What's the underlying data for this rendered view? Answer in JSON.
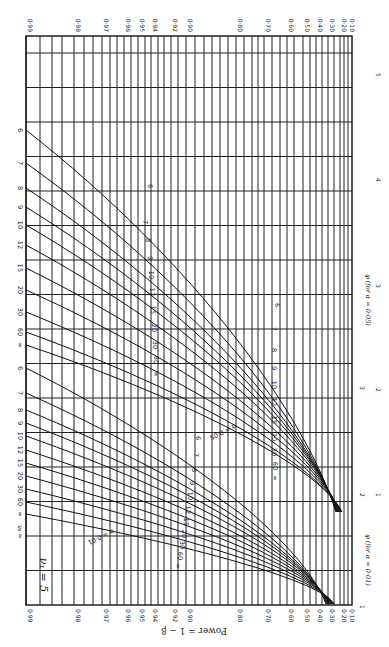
{
  "chart_data": {
    "type": "line",
    "orientation": "rotated 90° counter-clockwise (power axis runs horizontally, φ axis runs vertically)",
    "ylabel": "Power = 1 − β",
    "xlabel_alpha_05": "φ (for α = 0·05)",
    "xlabel_alpha_01": "φ (for α = 0·01)",
    "power_ticks": [
      "0·99",
      "0·98",
      "0·97",
      "0·96",
      "0·95",
      "0·94",
      "0·92",
      "0·90",
      "0·80",
      "0·70",
      "0·60",
      "0·50",
      "0·40",
      "0·30",
      "0·20",
      "0·10"
    ],
    "power_tick_values": [
      0.99,
      0.98,
      0.97,
      0.96,
      0.95,
      0.94,
      0.92,
      0.9,
      0.8,
      0.7,
      0.6,
      0.5,
      0.4,
      0.3,
      0.2,
      0.1
    ],
    "phi_ticks_alpha_05": [
      "1",
      "2",
      "3",
      "4",
      "5"
    ],
    "phi_ticks_alpha_01": [
      "1",
      "2",
      "3"
    ],
    "nu2_values": [
      "6",
      "7",
      "8",
      "9",
      "10",
      "12",
      "15",
      "20",
      "30",
      "60",
      "∞"
    ],
    "alpha_levels": [
      "α = 0·05",
      "α = 0·01"
    ],
    "annotations": [
      "α = 0·05",
      "α = 0·01",
      "ν1 = 5",
      "ν2 = ∞ 60 30 20 15 12 10 9 8 7 6"
    ],
    "series": [
      {
        "name": "α=0.05, ν2=6",
        "phi_at_power_0.99": 4.6,
        "phi_at_power_0.10": 1.2
      },
      {
        "name": "α=0.05, ν2=7",
        "phi_at_power_0.99": 4.2,
        "phi_at_power_0.10": 1.2
      },
      {
        "name": "α=0.05, ν2=8",
        "phi_at_power_0.99": 4.0,
        "phi_at_power_0.10": 1.2
      },
      {
        "name": "α=0.05, ν2=9",
        "phi_at_power_0.99": 3.8,
        "phi_at_power_0.10": 1.2
      },
      {
        "name": "α=0.05, ν2=10",
        "phi_at_power_0.99": 3.7,
        "phi_at_power_0.10": 1.2
      },
      {
        "name": "α=0.05, ν2=12",
        "phi_at_power_0.99": 3.5,
        "phi_at_power_0.10": 1.2
      },
      {
        "name": "α=0.05, ν2=15",
        "phi_at_power_0.99": 3.35,
        "phi_at_power_0.10": 1.2
      },
      {
        "name": "α=0.05, ν2=20",
        "phi_at_power_0.99": 3.2,
        "phi_at_power_0.10": 1.2
      },
      {
        "name": "α=0.05, ν2=30",
        "phi_at_power_0.99": 3.05,
        "phi_at_power_0.10": 1.2
      },
      {
        "name": "α=0.05, ν2=60",
        "phi_at_power_0.99": 2.9,
        "phi_at_power_0.10": 1.2
      },
      {
        "name": "α=0.05, ν2=∞",
        "phi_at_power_0.99": 2.8,
        "phi_at_power_0.10": 1.2
      }
    ],
    "grid": true,
    "legend": "none (curves labelled inline)"
  },
  "labels": {
    "nu1": "ν₁ = 5",
    "nu2_prefix": "ν₂ =",
    "power_axis": "Power = 1 − β",
    "phi_05": "φ (for α = 0·05)",
    "phi_01": "φ (for α = 0·01)",
    "alpha_05": "α = 0·05",
    "alpha_01": "α = 0·01"
  }
}
